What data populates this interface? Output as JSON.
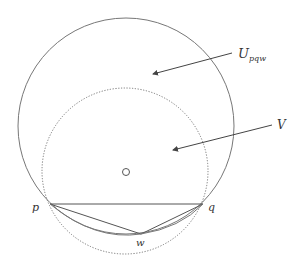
{
  "labels": {
    "U": "U",
    "U_sub": "pqw",
    "V": "V",
    "p": "p",
    "q": "q",
    "w": "w"
  },
  "colors": {
    "stroke": "#555555",
    "dotted": "#777777",
    "text": "#333333"
  }
}
